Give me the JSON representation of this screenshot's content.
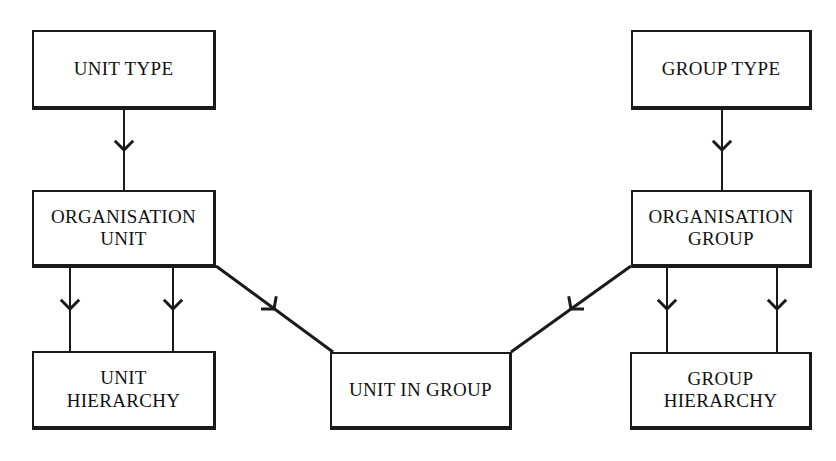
{
  "diagram": {
    "type": "entity-relationship-diagram",
    "background_color": "#ffffff",
    "line_color": "#1a1a1a",
    "text_color": "#111111",
    "entities": [
      {
        "id": "unit-type",
        "label": "UNIT TYPE",
        "x": 32,
        "y": 30,
        "width": 184,
        "height": 80
      },
      {
        "id": "organisation-unit",
        "label": "ORGANISATION\nUNIT",
        "x": 32,
        "y": 190,
        "width": 184,
        "height": 78
      },
      {
        "id": "unit-hierarchy",
        "label": "UNIT\nHIERARCHY",
        "x": 32,
        "y": 351,
        "width": 184,
        "height": 79
      },
      {
        "id": "unit-in-group",
        "label": "UNIT IN GROUP",
        "x": 330,
        "y": 352,
        "width": 182,
        "height": 78
      },
      {
        "id": "group-type",
        "label": "GROUP TYPE",
        "x": 631,
        "y": 30,
        "width": 181,
        "height": 80
      },
      {
        "id": "organisation-group",
        "label": "ORGANISATION\nGROUP",
        "x": 631,
        "y": 190,
        "width": 181,
        "height": 78
      },
      {
        "id": "group-hierarchy",
        "label": "GROUP\nHIERARCHY",
        "x": 630,
        "y": 352,
        "width": 182,
        "height": 78
      }
    ],
    "relationships": [
      {
        "id": "unit-type-to-organisation-unit",
        "from": "unit-type",
        "to": "organisation-unit",
        "kind": "vertical",
        "x1": 124,
        "y1": 110,
        "x2": 124,
        "y2": 190,
        "marker": "chevron-down",
        "marker_x": 124,
        "marker_y": 150
      },
      {
        "id": "organisation-unit-to-unit-hierarchy-left",
        "from": "organisation-unit",
        "to": "unit-hierarchy",
        "kind": "vertical",
        "x1": 70,
        "y1": 268,
        "x2": 70,
        "y2": 351,
        "marker": "chevron-down",
        "marker_x": 70,
        "marker_y": 309
      },
      {
        "id": "organisation-unit-to-unit-hierarchy-right",
        "from": "organisation-unit",
        "to": "unit-hierarchy",
        "kind": "vertical",
        "x1": 173,
        "y1": 268,
        "x2": 173,
        "y2": 351,
        "marker": "chevron-down",
        "marker_x": 173,
        "marker_y": 309
      },
      {
        "id": "organisation-unit-to-unit-in-group",
        "from": "organisation-unit",
        "to": "unit-in-group",
        "kind": "diagonal",
        "x1": 216,
        "y1": 266,
        "x2": 333,
        "y2": 352,
        "marker": "chevron-down-right",
        "marker_x": 274,
        "marker_y": 309
      },
      {
        "id": "group-type-to-organisation-group",
        "from": "group-type",
        "to": "organisation-group",
        "kind": "vertical",
        "x1": 722,
        "y1": 110,
        "x2": 722,
        "y2": 190,
        "marker": "chevron-down",
        "marker_x": 722,
        "marker_y": 150
      },
      {
        "id": "organisation-group-to-group-hierarchy-left",
        "from": "organisation-group",
        "to": "group-hierarchy",
        "kind": "vertical",
        "x1": 667,
        "y1": 268,
        "x2": 667,
        "y2": 352,
        "marker": "chevron-down",
        "marker_x": 667,
        "marker_y": 309
      },
      {
        "id": "organisation-group-to-group-hierarchy-right",
        "from": "organisation-group",
        "to": "group-hierarchy",
        "kind": "vertical",
        "x1": 777,
        "y1": 268,
        "x2": 777,
        "y2": 352,
        "marker": "chevron-down",
        "marker_x": 777,
        "marker_y": 309
      },
      {
        "id": "organisation-group-to-unit-in-group",
        "from": "organisation-group",
        "to": "unit-in-group",
        "kind": "diagonal",
        "x1": 631,
        "y1": 266,
        "x2": 511,
        "y2": 352,
        "marker": "chevron-down-left",
        "marker_x": 571,
        "marker_y": 309
      }
    ]
  }
}
